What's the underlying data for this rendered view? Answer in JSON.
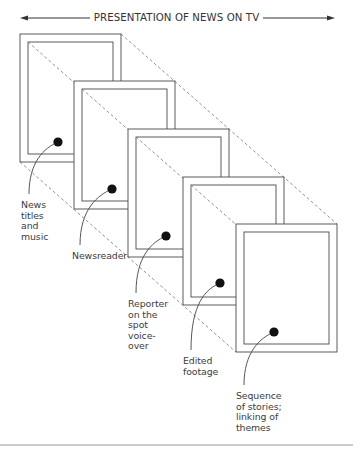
{
  "title": "PRESENTATION OF NEWS ON TV",
  "frames": [
    {
      "label": "News\ntitles\nand\nmusic",
      "x": 20,
      "y": 34,
      "dot": [
        58,
        142
      ],
      "label_pos": [
        21,
        200
      ]
    },
    {
      "label": "Newsreader",
      "x": 74,
      "y": 81,
      "dot": [
        112,
        189
      ],
      "label_pos": [
        72,
        251
      ]
    },
    {
      "label": "Reporter\non the\nspot\nvoice-\nover",
      "x": 128,
      "y": 129,
      "dot": [
        166,
        236
      ],
      "label_pos": [
        128,
        299
      ]
    },
    {
      "label": "Edited\nfootage",
      "x": 183,
      "y": 177,
      "dot": [
        220,
        283
      ],
      "label_pos": [
        183,
        356
      ]
    },
    {
      "label": "Sequence\nof stories;\nlinking of\nthemes",
      "x": 236,
      "y": 224,
      "dot": [
        274,
        332
      ],
      "label_pos": [
        236,
        391
      ]
    }
  ],
  "frame_size": {
    "outer_w": 101,
    "outer_h": 128,
    "inset": 8
  },
  "colors": {
    "line": "#4a4a4a",
    "dash": "#777777",
    "dot": "#111111",
    "rule": "#9a9a9a"
  }
}
